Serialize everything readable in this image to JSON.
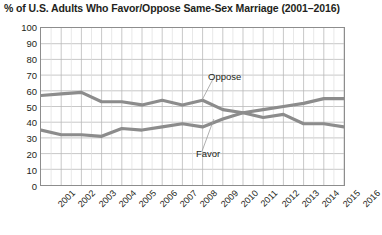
{
  "chart_data": {
    "type": "line",
    "title": "% of U.S. Adults Who Favor/Oppose Same-Sex Marriage (2001–2016)",
    "xlabel": "",
    "ylabel": "",
    "ylim": [
      0,
      100
    ],
    "ytick_step": 10,
    "yticks": [
      100,
      90,
      80,
      70,
      60,
      50,
      40,
      30,
      20,
      10,
      0
    ],
    "categories": [
      "2001",
      "2002",
      "2003",
      "2004",
      "2005",
      "2006",
      "2007",
      "2008",
      "2009",
      "2010",
      "2011",
      "2012",
      "2013",
      "2014",
      "2015",
      "2016"
    ],
    "grid": true,
    "legend_position": "inline-annotations",
    "series": [
      {
        "name": "Oppose",
        "color": "#8c8c8c",
        "values": [
          57,
          58,
          59,
          53,
          53,
          51,
          54,
          51,
          54,
          48,
          46,
          43,
          45,
          39,
          39,
          37
        ]
      },
      {
        "name": "Favor",
        "color": "#8c8c8c",
        "values": [
          35,
          32,
          32,
          31,
          36,
          35,
          37,
          39,
          37,
          42,
          46,
          48,
          50,
          52,
          55,
          55
        ]
      }
    ],
    "annotations": [
      {
        "text": "Oppose",
        "series": "Oppose"
      },
      {
        "text": "Favor",
        "series": "Favor"
      }
    ]
  },
  "colors": {
    "line": "#8c8c8c",
    "grid_major": "#b9b9b9",
    "grid_minor": "#dedede",
    "frame": "#8d8d8d",
    "text": "#231f20",
    "background": "#ffffff"
  }
}
